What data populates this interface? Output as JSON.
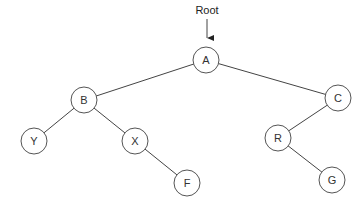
{
  "diagram": {
    "type": "binary-tree",
    "root_annotation": {
      "label": "Root",
      "x": 207,
      "y": 14,
      "arrow_from": [
        207,
        19
      ],
      "arrow_to": [
        207,
        44
      ]
    },
    "node_radius": 13,
    "nodes": [
      {
        "id": "A",
        "label": "A",
        "x": 206,
        "y": 60
      },
      {
        "id": "B",
        "label": "B",
        "x": 84,
        "y": 100
      },
      {
        "id": "C",
        "label": "C",
        "x": 338,
        "y": 98
      },
      {
        "id": "Y",
        "label": "Y",
        "x": 34,
        "y": 141
      },
      {
        "id": "X",
        "label": "X",
        "x": 135,
        "y": 141
      },
      {
        "id": "F",
        "label": "F",
        "x": 187,
        "y": 183
      },
      {
        "id": "R",
        "label": "R",
        "x": 278,
        "y": 138
      },
      {
        "id": "G",
        "label": "G",
        "x": 332,
        "y": 180
      }
    ],
    "edges": [
      {
        "from": "A",
        "to": "B"
      },
      {
        "from": "A",
        "to": "C"
      },
      {
        "from": "B",
        "to": "Y"
      },
      {
        "from": "B",
        "to": "X"
      },
      {
        "from": "X",
        "to": "F"
      },
      {
        "from": "C",
        "to": "R"
      },
      {
        "from": "R",
        "to": "G"
      }
    ],
    "colors": {
      "edge": "#444444",
      "node_stroke": "#555555",
      "node_fill": "#ffffff",
      "text": "#333333"
    }
  }
}
